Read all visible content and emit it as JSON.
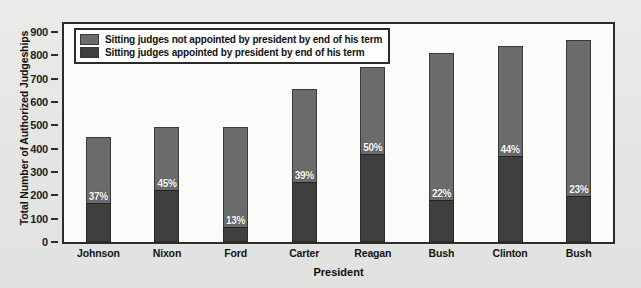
{
  "chart_data": {
    "type": "bar",
    "stacked": true,
    "title": "",
    "xlabel": "President",
    "ylabel": "Total Number of Authorized Judgeships",
    "ylim": [
      0,
      900
    ],
    "yticks": [
      0,
      100,
      200,
      300,
      400,
      500,
      600,
      700,
      800,
      900
    ],
    "grid": false,
    "legend_position": "top-left",
    "categories": [
      "Johnson",
      "Nixon",
      "Ford",
      "Carter",
      "Reagan",
      "Bush",
      "Clinton",
      "Bush"
    ],
    "series": [
      {
        "name": "Sitting judges not appointed by president by end of his term",
        "color": "#6b6b6b",
        "values": [
          284,
          272,
          431,
          401,
          376,
          633,
          471,
          668
        ]
      },
      {
        "name": "Sitting judges appointed by president by end of his term",
        "color": "#3f3f3f",
        "values": [
          166,
          223,
          64,
          256,
          376,
          179,
          370,
          199
        ]
      }
    ],
    "totals": [
      450,
      495,
      495,
      657,
      752,
      812,
      841,
      867
    ],
    "point_labels": [
      "37%",
      "45%",
      "13%",
      "39%",
      "50%",
      "22%",
      "44%",
      "23%"
    ],
    "point_label_note": "percent of sitting judges appointed by that president by end of his term"
  },
  "legend": {
    "items": [
      {
        "label": "Sitting judges not appointed by president by end of his term",
        "color": "#6b6b6b"
      },
      {
        "label": "Sitting judges appointed by president by end of his term",
        "color": "#3f3f3f"
      }
    ]
  },
  "axes": {
    "y_title": "Total Number of Authorized Judgeships",
    "x_title": "President",
    "y_ticks": [
      "900",
      "800",
      "700",
      "600",
      "500",
      "400",
      "300",
      "200",
      "100",
      "0"
    ]
  }
}
